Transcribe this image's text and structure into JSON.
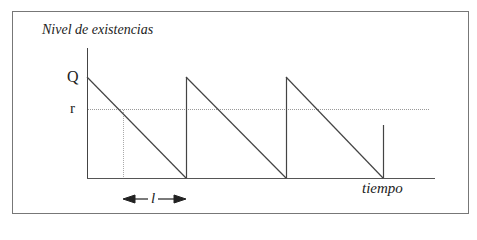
{
  "diagram": {
    "y_axis_title": "Nivel de existencias",
    "x_axis_title": "tiempo",
    "labels": {
      "Q": "Q",
      "r": "r",
      "lead_time": "l"
    },
    "colors": {
      "frame": "#777777",
      "line": "#444444",
      "dotted": "#999999",
      "text": "#222222"
    }
  }
}
